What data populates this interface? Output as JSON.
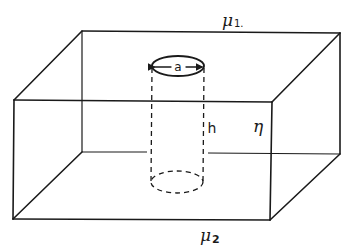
{
  "diagram": {
    "labels": {
      "top_medium": "μ",
      "top_medium_sub": "1.",
      "bottom_medium": "μ",
      "bottom_medium_sub": "2",
      "cylinder_diameter": "a",
      "cylinder_height": "h",
      "slab_property": "η"
    },
    "colors": {
      "line": "#1a1a1a",
      "background": "#ffffff"
    }
  }
}
